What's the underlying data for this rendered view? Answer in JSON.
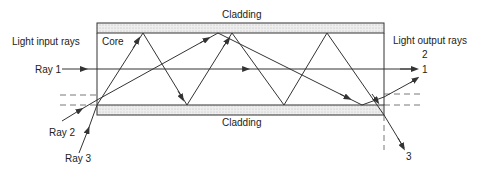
{
  "diagram": {
    "type": "optical-fiber-ray-propagation",
    "labels": {
      "cladding_top": "Cladding",
      "cladding_bottom": "Cladding",
      "core": "Core",
      "input": "Light input rays",
      "output": "Light output rays",
      "ray1": "Ray 1",
      "ray2": "Ray 2",
      "ray3": "Ray 3",
      "out1": "1",
      "out2": "2",
      "out3": "3"
    },
    "colors": {
      "line": "#333333",
      "cladding_fill": "#e6e6e6",
      "background": "#ffffff"
    }
  }
}
